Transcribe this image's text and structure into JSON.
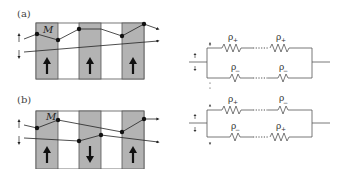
{
  "panels": [
    {
      "id": "a",
      "label": "(a)",
      "layer_label": "M",
      "magnetizations": [
        "up",
        "up",
        "up"
      ],
      "circuit": {
        "top_channel": {
          "spin": "up",
          "resistors": [
            {
              "symbol": "ρ",
              "sub": "+"
            },
            {
              "symbol": "ρ",
              "sub": "+"
            }
          ]
        },
        "bottom_channel": {
          "spin": "down",
          "resistors": [
            {
              "symbol": "ρ",
              "sub": "−"
            },
            {
              "symbol": "ρ",
              "sub": "−"
            }
          ]
        },
        "ellipsis": "......"
      }
    },
    {
      "id": "b",
      "label": "(b)",
      "layer_label": "M",
      "magnetizations": [
        "up",
        "down",
        "up"
      ],
      "circuit": {
        "top_channel": {
          "spin": "up",
          "resistors": [
            {
              "symbol": "ρ",
              "sub": "+"
            },
            {
              "symbol": "ρ",
              "sub": "−"
            }
          ]
        },
        "bottom_channel": {
          "spin": "down",
          "resistors": [
            {
              "symbol": "ρ",
              "sub": "−"
            },
            {
              "symbol": "ρ",
              "sub": "+"
            }
          ]
        },
        "ellipsis": "......"
      }
    }
  ],
  "colors": {
    "magnetic_layer": "#b3b3b3",
    "spacer_layer": "#ffffff",
    "line": "#222222",
    "wire": "#555555"
  }
}
